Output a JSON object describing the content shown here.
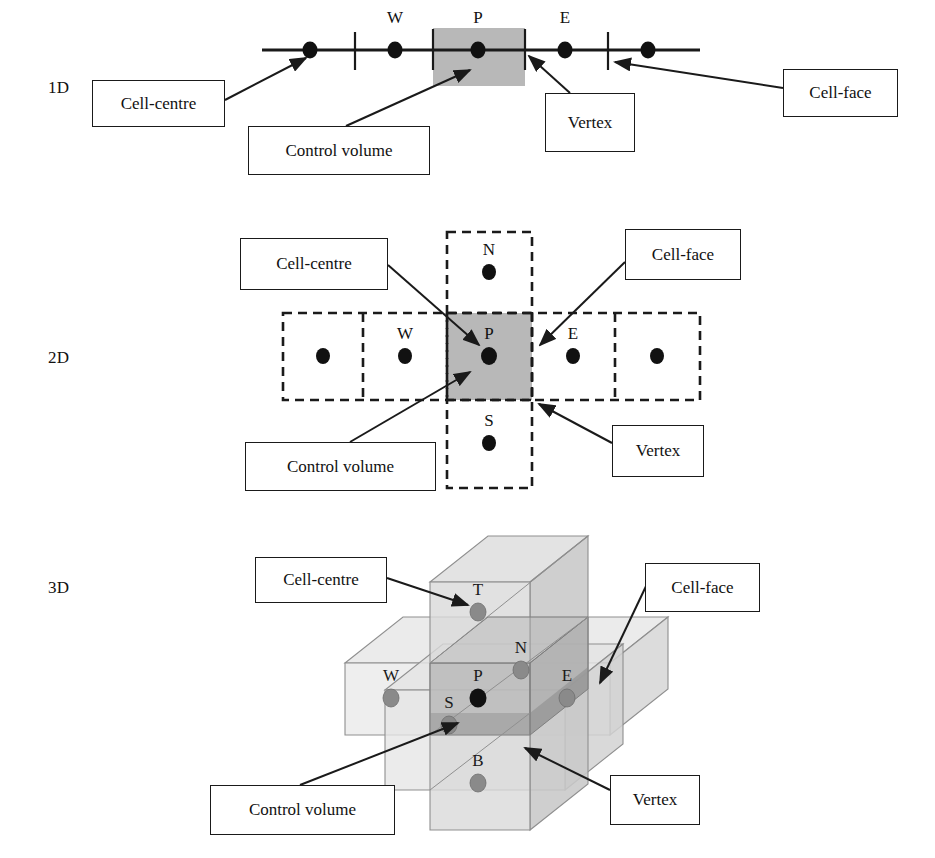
{
  "figure": {
    "colors": {
      "ink": "#1a1a1a",
      "control_volume_fill_2d": "#b3b3b3",
      "box_fill_light": "#e0e0e0",
      "box_fill_mid": "#c4c4c4",
      "box_fill_dark": "#a8a8a8",
      "node_dark": "#111111",
      "node_grey": "#8a8a8a"
    }
  },
  "sections": [
    {
      "id": "1d",
      "dim_label": "1D",
      "nodes": [
        {
          "id": "w-outer",
          "label": "",
          "x": 310,
          "y": 50
        },
        {
          "id": "w",
          "label": "W",
          "x": 395,
          "y": 50
        },
        {
          "id": "p",
          "label": "P",
          "x": 478,
          "y": 50
        },
        {
          "id": "e",
          "label": "E",
          "x": 565,
          "y": 50
        },
        {
          "id": "e-outer",
          "label": "",
          "x": 648,
          "y": 50
        }
      ],
      "faces_x": [
        355,
        433,
        525,
        608
      ],
      "control_volume": {
        "x": 433,
        "y": 28,
        "w": 92,
        "h": 58
      },
      "callouts": [
        {
          "id": "cell-centre",
          "label": "Cell-centre",
          "x": 92,
          "y": 80,
          "w": 133,
          "h": 47
        },
        {
          "id": "control-volume",
          "label": "Control volume",
          "x": 248,
          "y": 126,
          "w": 182,
          "h": 49
        },
        {
          "id": "vertex",
          "label": "Vertex",
          "x": 545,
          "y": 93,
          "w": 90,
          "h": 59
        },
        {
          "id": "cell-face",
          "label": "Cell-face",
          "x": 783,
          "y": 69,
          "w": 115,
          "h": 48
        }
      ]
    },
    {
      "id": "2d",
      "dim_label": "2D",
      "nodes": [
        {
          "id": "ww",
          "label": "",
          "x": 323,
          "y": 356
        },
        {
          "id": "w",
          "label": "W",
          "x": 405,
          "y": 356
        },
        {
          "id": "p",
          "label": "P",
          "x": 489,
          "y": 356
        },
        {
          "id": "e",
          "label": "E",
          "x": 573,
          "y": 356
        },
        {
          "id": "ee",
          "label": "",
          "x": 657,
          "y": 356
        },
        {
          "id": "n",
          "label": "N",
          "x": 489,
          "y": 272
        },
        {
          "id": "s",
          "label": "S",
          "x": 489,
          "y": 443
        }
      ],
      "control_volume": {
        "x": 447,
        "y": 313,
        "w": 85,
        "h": 87
      },
      "callouts": [
        {
          "id": "cell-centre",
          "label": "Cell-centre",
          "x": 240,
          "y": 238,
          "w": 148,
          "h": 52
        },
        {
          "id": "cell-face",
          "label": "Cell-face",
          "x": 625,
          "y": 229,
          "w": 116,
          "h": 51
        },
        {
          "id": "control-volume",
          "label": "Control volume",
          "x": 245,
          "y": 442,
          "w": 191,
          "h": 49
        },
        {
          "id": "vertex",
          "label": "Vertex",
          "x": 612,
          "y": 425,
          "w": 92,
          "h": 52
        }
      ]
    },
    {
      "id": "3d",
      "dim_label": "3D",
      "nodes": [
        {
          "id": "t",
          "label": "T",
          "x": 478,
          "y": 612
        },
        {
          "id": "n",
          "label": "N",
          "x": 521,
          "y": 670
        },
        {
          "id": "w",
          "label": "W",
          "x": 391,
          "y": 698
        },
        {
          "id": "p",
          "label": "P",
          "x": 478,
          "y": 698
        },
        {
          "id": "e",
          "label": "E",
          "x": 567,
          "y": 698
        },
        {
          "id": "s",
          "label": "S",
          "x": 449,
          "y": 725
        },
        {
          "id": "b",
          "label": "B",
          "x": 478,
          "y": 783
        }
      ],
      "callouts": [
        {
          "id": "cell-centre",
          "label": "Cell-centre",
          "x": 255,
          "y": 557,
          "w": 132,
          "h": 46
        },
        {
          "id": "cell-face",
          "label": "Cell-face",
          "x": 645,
          "y": 563,
          "w": 115,
          "h": 49
        },
        {
          "id": "control-volume",
          "label": "Control volume",
          "x": 210,
          "y": 785,
          "w": 185,
          "h": 50
        },
        {
          "id": "vertex",
          "label": "Vertex",
          "x": 610,
          "y": 775,
          "w": 90,
          "h": 50
        }
      ]
    }
  ],
  "dim_labels": [
    {
      "id": "label-1d",
      "text": "1D",
      "x": 48,
      "y": 78
    },
    {
      "id": "label-2d",
      "text": "2D",
      "x": 48,
      "y": 348
    },
    {
      "id": "label-3d",
      "text": "3D",
      "x": 48,
      "y": 578
    }
  ]
}
